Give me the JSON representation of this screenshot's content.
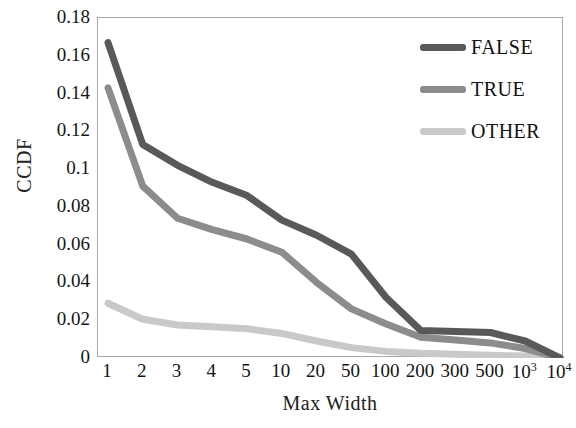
{
  "chart_data": {
    "type": "line",
    "title": "",
    "xlabel": "Max Width",
    "ylabel": "CCDF",
    "categories": [
      "1",
      "2",
      "3",
      "4",
      "5",
      "10",
      "20",
      "50",
      "100",
      "200",
      "300",
      "500",
      "10³",
      "10⁴"
    ],
    "category_labels_html": [
      "1",
      "2",
      "3",
      "4",
      "5",
      "10",
      "20",
      "50",
      "100",
      "200",
      "300",
      "500",
      "10<sup>3</sup>",
      "10<sup>4</sup>"
    ],
    "xlim": [
      0,
      13
    ],
    "ylim": [
      0,
      0.18
    ],
    "yticks": [
      0,
      0.02,
      0.04,
      0.06,
      0.08,
      0.1,
      0.12,
      0.14,
      0.16,
      0.18
    ],
    "ytick_labels": [
      "0",
      "0.02",
      "0.04",
      "0.06",
      "0.08",
      "0.1",
      "0.12",
      "0.14",
      "0.16",
      "0.18"
    ],
    "grid": false,
    "legend_position": "top-right",
    "series": [
      {
        "name": "FALSE",
        "color": "#595959",
        "values": [
          0.167,
          0.113,
          0.102,
          0.093,
          0.086,
          0.073,
          0.065,
          0.055,
          0.032,
          0.0145,
          0.014,
          0.0135,
          0.009,
          0.0
        ]
      },
      {
        "name": "TRUE",
        "color": "#8c8c8c",
        "values": [
          0.143,
          0.091,
          0.074,
          0.068,
          0.063,
          0.056,
          0.04,
          0.026,
          0.018,
          0.011,
          0.0095,
          0.008,
          0.005,
          0.0
        ]
      },
      {
        "name": "OTHER",
        "color": "#c9c9c9",
        "values": [
          0.029,
          0.0205,
          0.0175,
          0.0165,
          0.0155,
          0.013,
          0.009,
          0.0055,
          0.0035,
          0.0025,
          0.002,
          0.0015,
          0.001,
          0.0
        ]
      }
    ]
  },
  "legend": {
    "items": [
      {
        "label": "FALSE",
        "color": "#595959"
      },
      {
        "label": "TRUE",
        "color": "#8c8c8c"
      },
      {
        "label": "OTHER",
        "color": "#c9c9c9"
      }
    ]
  },
  "axes": {
    "y_title": "CCDF",
    "x_title": "Max Width"
  }
}
